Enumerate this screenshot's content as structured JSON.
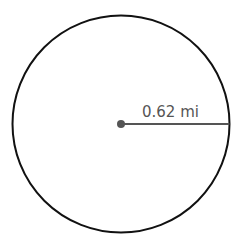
{
  "diagram": {
    "shape": "circle",
    "radius_label": "0.62 mi",
    "colors": {
      "outline": "#111111",
      "radius_line": "#555555",
      "center_dot": "#555555",
      "label": "#555555",
      "background": "#ffffff"
    }
  }
}
